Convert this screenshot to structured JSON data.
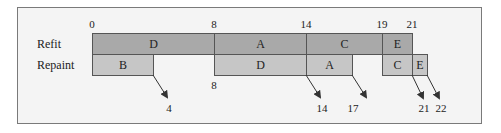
{
  "diagram": {
    "type": "gantt",
    "scale": {
      "origin_px": 92,
      "px_per_unit": 15.25
    },
    "rows": [
      {
        "label": "Refit",
        "tasks": [
          {
            "name": "D",
            "start": 0,
            "end": 8
          },
          {
            "name": "A",
            "start": 8,
            "end": 14
          },
          {
            "name": "C",
            "start": 14,
            "end": 19
          },
          {
            "name": "E",
            "start": 19,
            "end": 21
          }
        ]
      },
      {
        "label": "Repaint",
        "tasks": [
          {
            "name": "B",
            "start": 0,
            "end": 4
          },
          {
            "name": "D",
            "start": 8,
            "end": 14
          },
          {
            "name": "A",
            "start": 14,
            "end": 17
          },
          {
            "name": "C",
            "start": 19,
            "end": 21
          },
          {
            "name": "E",
            "start": 21,
            "end": 22
          }
        ]
      }
    ],
    "top_ticks": [
      "0",
      "8",
      "14",
      "19",
      "21"
    ],
    "below_ticks": [
      "8"
    ],
    "arrow_end_labels": [
      "4",
      "14",
      "17",
      "21",
      "22"
    ],
    "colors": {
      "refit": "#a9a9a9",
      "repaint": "#c6c6c6",
      "border": "#555555"
    }
  }
}
